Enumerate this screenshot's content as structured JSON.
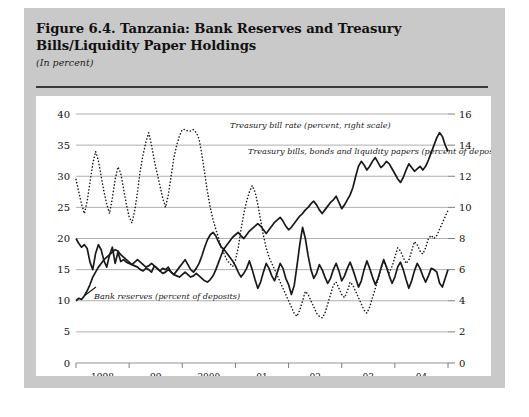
{
  "figure": {
    "title": "Figure 6.4. Tanzania: Bank Reserves and Treasury Bills/Liquidity Paper Holdings",
    "subtitle": "(In percent)"
  },
  "chart_data": {
    "type": "line",
    "title": "Figure 6.4. Tanzania: Bank Reserves and Treasury Bills/Liquidity Paper Holdings",
    "subtitle": "(In percent)",
    "xlabel": "",
    "ylabel": "",
    "grid": true,
    "legend_position": "inline-annotations",
    "x_tick_labels": [
      "1998",
      "99",
      "2000",
      "01",
      "02",
      "03",
      "04"
    ],
    "x_range_description": "monthly observations, January 1998 through late 2004",
    "left_axis": {
      "ticks": [
        0,
        5,
        10,
        15,
        20,
        25,
        30,
        35,
        40
      ],
      "ylim": [
        0,
        40
      ],
      "applies_to": [
        "Bank reserves (percent of deposits)",
        "Treasury bills, bonds and liquidity papers (percent of deposits)"
      ]
    },
    "right_axis": {
      "ticks": [
        0,
        2,
        4,
        6,
        8,
        10,
        12,
        14,
        16
      ],
      "ylim": [
        0,
        16
      ],
      "applies_to": [
        "Treasury bill rate (percent, right scale)"
      ]
    },
    "annotations": [
      "Treasury bill rate (percent, right scale)",
      "Treasury bills, bonds and liquidity papers (percent of deposits)",
      "Bank reserves (percent of deposits)"
    ],
    "series": [
      {
        "name": "Bank reserves (percent of deposits)",
        "axis": "left",
        "style": "solid",
        "color": "#1a1a1a",
        "values": [
          20.0,
          19.2,
          18.6,
          19.0,
          18.4,
          16.2,
          15.0,
          17.6,
          19.0,
          18.2,
          16.4,
          15.4,
          17.4,
          18.6,
          16.0,
          17.8,
          16.3,
          16.6,
          16.2,
          16.0,
          15.8,
          15.6,
          15.4,
          15.0,
          14.8,
          15.2,
          15.0,
          14.6,
          15.6,
          15.2,
          14.8,
          15.2,
          15.0,
          15.4,
          14.6,
          14.2,
          14.8,
          15.4,
          16.0,
          16.6,
          15.8,
          15.0,
          14.6,
          15.2,
          16.0,
          17.2,
          18.6,
          19.8,
          20.6,
          21.0,
          20.4,
          19.4,
          18.6,
          18.2,
          17.6,
          17.0,
          16.4,
          15.6,
          14.6,
          13.8,
          14.4,
          15.2,
          16.4,
          15.0,
          13.4,
          12.0,
          13.0,
          14.6,
          16.0,
          15.2,
          14.0,
          13.2,
          14.6,
          16.0,
          15.2,
          13.6,
          12.6,
          11.0,
          12.4,
          15.6,
          19.0,
          21.8,
          20.0,
          17.2,
          15.0,
          13.6,
          14.4,
          15.8,
          15.0,
          13.8,
          12.8,
          13.6,
          15.0,
          16.0,
          14.8,
          13.2,
          14.0,
          15.2,
          16.2,
          15.0,
          13.6,
          12.2,
          13.2,
          15.0,
          16.4,
          15.2,
          13.8,
          12.6,
          13.6,
          15.2,
          16.6,
          15.4,
          14.0,
          12.8,
          13.8,
          15.4,
          16.2,
          15.0,
          13.4,
          12.0,
          13.2,
          14.8,
          16.0,
          15.2,
          14.0,
          13.0,
          14.0,
          15.2,
          15.0,
          14.6,
          12.8,
          12.2,
          13.6,
          15.0
        ]
      },
      {
        "name": "Treasury bills, bonds and liquidity papers (percent of deposits)",
        "axis": "left",
        "style": "solid",
        "color": "#1a1a1a",
        "values": [
          10.0,
          10.4,
          10.2,
          10.8,
          11.6,
          12.6,
          13.8,
          14.6,
          15.4,
          16.0,
          16.6,
          17.0,
          17.4,
          17.8,
          18.2,
          18.0,
          17.4,
          17.0,
          16.6,
          16.2,
          15.8,
          16.2,
          16.6,
          16.2,
          15.8,
          15.4,
          15.6,
          16.0,
          15.6,
          15.2,
          14.8,
          14.4,
          14.6,
          15.0,
          14.6,
          14.2,
          14.0,
          13.8,
          14.2,
          14.6,
          14.2,
          13.8,
          14.0,
          14.4,
          14.0,
          13.6,
          13.2,
          13.0,
          13.4,
          14.0,
          15.0,
          16.2,
          17.4,
          18.4,
          19.0,
          19.6,
          20.2,
          20.6,
          21.0,
          20.4,
          20.0,
          20.6,
          21.2,
          21.6,
          22.0,
          22.4,
          22.0,
          21.4,
          20.8,
          21.4,
          22.0,
          22.6,
          23.0,
          23.4,
          22.8,
          22.0,
          21.4,
          21.8,
          22.4,
          23.0,
          23.6,
          24.0,
          24.6,
          25.0,
          25.6,
          26.0,
          25.4,
          24.6,
          24.0,
          24.6,
          25.2,
          25.8,
          26.2,
          26.8,
          25.8,
          24.8,
          25.4,
          26.2,
          27.0,
          28.2,
          30.0,
          31.6,
          32.4,
          31.8,
          31.0,
          31.6,
          32.4,
          33.0,
          32.2,
          31.4,
          31.8,
          32.4,
          32.0,
          31.2,
          30.4,
          29.6,
          29.0,
          29.8,
          31.0,
          32.0,
          31.4,
          30.8,
          31.2,
          31.6,
          31.0,
          31.6,
          32.6,
          33.8,
          35.0,
          36.2,
          37.0,
          36.4,
          35.0,
          34.0
        ]
      },
      {
        "name": "Treasury bill rate (percent, right scale)",
        "axis": "right",
        "style": "dotted",
        "color": "#1a1a1a",
        "values": [
          11.8,
          11.0,
          10.2,
          9.6,
          10.4,
          11.6,
          12.8,
          13.6,
          13.0,
          12.0,
          11.0,
          10.2,
          9.6,
          10.6,
          11.8,
          12.6,
          12.2,
          11.2,
          10.2,
          9.4,
          9.0,
          9.8,
          11.0,
          12.4,
          13.4,
          14.2,
          14.8,
          14.0,
          13.0,
          12.2,
          11.4,
          10.6,
          10.0,
          10.8,
          12.0,
          13.2,
          14.0,
          14.6,
          15.0,
          15.0,
          14.9,
          14.9,
          15.0,
          14.8,
          14.4,
          13.4,
          12.2,
          11.0,
          10.0,
          9.2,
          8.6,
          8.0,
          7.4,
          7.0,
          6.6,
          6.4,
          6.2,
          6.6,
          7.4,
          8.6,
          9.6,
          10.4,
          11.0,
          11.4,
          11.0,
          10.2,
          9.2,
          8.2,
          7.4,
          6.8,
          6.4,
          6.0,
          5.6,
          5.2,
          4.8,
          4.4,
          4.0,
          3.6,
          3.2,
          3.0,
          3.4,
          4.0,
          4.6,
          4.4,
          4.0,
          3.6,
          3.2,
          3.0,
          2.9,
          3.2,
          3.8,
          4.4,
          5.0,
          5.2,
          4.8,
          4.4,
          4.2,
          4.6,
          5.2,
          5.0,
          4.6,
          4.2,
          3.8,
          3.4,
          3.2,
          3.6,
          4.2,
          4.8,
          5.4,
          6.0,
          6.6,
          6.2,
          5.8,
          6.2,
          6.8,
          7.4,
          7.2,
          6.8,
          6.4,
          6.6,
          7.2,
          7.8,
          7.6,
          7.2,
          7.0,
          7.4,
          8.0,
          8.2,
          8.0,
          8.2,
          8.6,
          9.0,
          9.4,
          9.8
        ]
      }
    ]
  }
}
